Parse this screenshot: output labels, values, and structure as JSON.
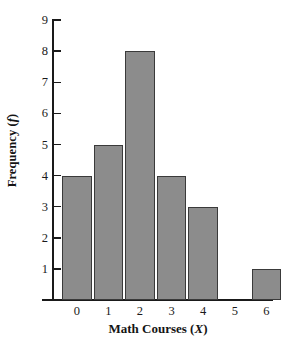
{
  "chart_data": {
    "type": "bar",
    "title": "",
    "categories": [
      "0",
      "1",
      "2",
      "3",
      "4",
      "5",
      "6"
    ],
    "values": [
      4,
      5,
      8,
      4,
      3,
      0,
      1
    ],
    "xlabel": "Math Courses (X)",
    "xlabel_text": "Math Courses (",
    "xlabel_var": "X",
    "xlabel_tail": ")",
    "ylabel": "Frequency (f)",
    "ylabel_text": "Frequency (",
    "ylabel_var": "f",
    "ylabel_tail": ")",
    "ylim": [
      0,
      9
    ],
    "yticks": [
      1,
      2,
      3,
      4,
      5,
      6,
      7,
      8,
      9
    ],
    "ytick_labels": [
      "1",
      "2",
      "3",
      "4",
      "5",
      "6",
      "7",
      "8",
      "9"
    ],
    "grid": false,
    "legend": false,
    "bar_color": "#8c8c8c",
    "bar_edge_color": "#3a3a3a",
    "axis_color": "#1a1a1a",
    "background": "#ffffff"
  }
}
